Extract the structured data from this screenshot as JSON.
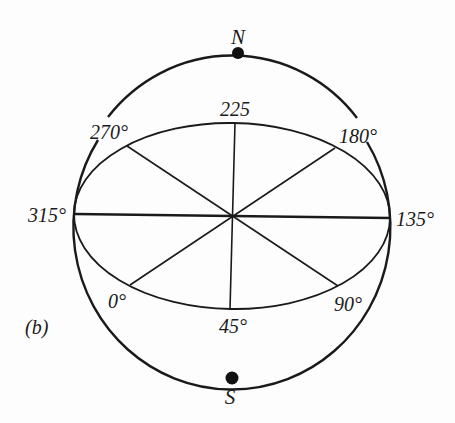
{
  "figure": {
    "panel_label": "(b)",
    "poles": {
      "north": "N",
      "south": "S"
    },
    "azimuth_labels": {
      "deg_0": "0°",
      "deg_45": "45°",
      "deg_90": "90°",
      "deg_135": "135°",
      "deg_180": "180°",
      "deg_225": "225",
      "deg_270": "270°",
      "deg_315": "315°"
    },
    "colors": {
      "ink": "#1a1a1a",
      "background": "#fdfdfd"
    }
  }
}
